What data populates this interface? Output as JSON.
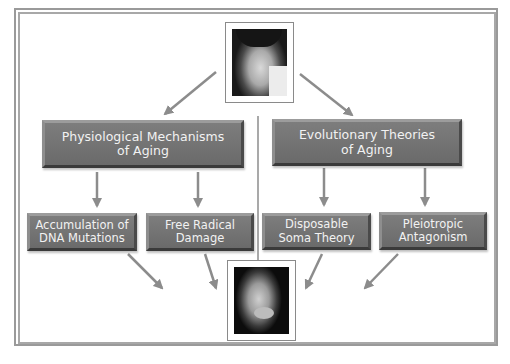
{
  "diagram": {
    "top_photo": {
      "label": "young-man-portrait"
    },
    "bottom_photo": {
      "label": "older-man-portrait"
    },
    "categories": [
      {
        "title_line1": "Physiological Mechanisms",
        "title_line2": "of Aging",
        "children": [
          {
            "line1": "Accumulation of",
            "line2": "DNA Mutations"
          },
          {
            "line1": "Free Radical",
            "line2": "Damage"
          }
        ]
      },
      {
        "title_line1": "Evolutionary Theories",
        "title_line2": "of Aging",
        "children": [
          {
            "line1": "Disposable",
            "line2": "Soma Theory"
          },
          {
            "line1": "Pleiotropic",
            "line2": "Antagonism"
          }
        ]
      }
    ],
    "colors": {
      "box_fill": "#747474",
      "arrow": "#8c8c8c",
      "frame": "#9a9a9a",
      "text": "#f2f2f2"
    }
  }
}
